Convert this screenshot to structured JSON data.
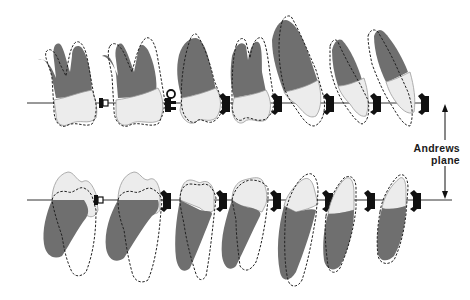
{
  "figure": {
    "label_line1": "Andrews",
    "label_line2": "plane",
    "upper_arch": {
      "plane_y": 103,
      "teeth": [
        "second-molar",
        "first-molar",
        "second-premolar",
        "first-premolar",
        "canine",
        "lateral-incisor",
        "central-incisor"
      ]
    },
    "lower_arch": {
      "plane_y": 200,
      "teeth": [
        "second-molar",
        "first-molar",
        "second-premolar",
        "first-premolar",
        "canine",
        "lateral-incisor",
        "central-incisor"
      ]
    },
    "colors": {
      "root": "#6f6f6f",
      "crown": "#ececec",
      "outline": "#222222"
    }
  }
}
